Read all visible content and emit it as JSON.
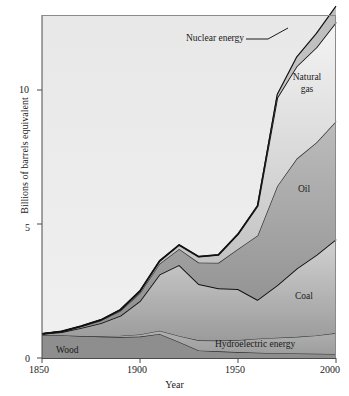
{
  "chart_data": {
    "type": "area",
    "title": "",
    "xlabel": "Year",
    "ylabel": "Billions of barrels equivalent",
    "xlim": [
      1850,
      2000
    ],
    "ylim": [
      0,
      13.1
    ],
    "xticks": [
      "1850",
      "1900",
      "1950",
      "2000"
    ],
    "xtick_values": [
      1850,
      1900,
      1950,
      2000
    ],
    "yticks": [
      "0",
      "5",
      "10"
    ],
    "ytick_values": [
      0,
      5,
      10
    ],
    "grid": false,
    "legend": "inline-band-labels",
    "stacked": true,
    "x": [
      1850,
      1860,
      1870,
      1880,
      1890,
      1900,
      1910,
      1920,
      1930,
      1940,
      1950,
      1960,
      1970,
      1980,
      1990,
      2000
    ],
    "series": [
      {
        "name": "Wood",
        "color": "#8e8e8e",
        "values": [
          0.85,
          0.85,
          0.82,
          0.8,
          0.78,
          0.8,
          0.9,
          0.6,
          0.28,
          0.25,
          0.22,
          0.2,
          0.18,
          0.17,
          0.16,
          0.15
        ]
      },
      {
        "name": "Hydroelectric energy",
        "color": "#a8a8a8",
        "values": [
          0.0,
          0.0,
          0.0,
          0.02,
          0.05,
          0.08,
          0.12,
          0.22,
          0.38,
          0.4,
          0.45,
          0.52,
          0.58,
          0.62,
          0.68,
          0.78
        ]
      },
      {
        "name": "Coal",
        "color": "#b4b4b4",
        "values": [
          0.05,
          0.12,
          0.3,
          0.48,
          0.75,
          1.25,
          2.1,
          2.65,
          2.1,
          1.95,
          1.9,
          1.45,
          1.95,
          2.55,
          3.0,
          3.5
        ]
      },
      {
        "name": "Oil",
        "color": "#9a9a9a",
        "values": [
          0.0,
          0.02,
          0.06,
          0.1,
          0.18,
          0.3,
          0.4,
          0.6,
          0.8,
          0.95,
          1.5,
          2.4,
          3.7,
          4.1,
          4.2,
          4.4
        ]
      },
      {
        "name": "Natural gas",
        "color": "#cfcfcf",
        "values": [
          0.0,
          0.0,
          0.01,
          0.02,
          0.04,
          0.07,
          0.1,
          0.15,
          0.22,
          0.3,
          0.55,
          1.1,
          3.3,
          3.45,
          3.55,
          3.7
        ]
      },
      {
        "name": "Nuclear energy",
        "color": "#bdbdbd",
        "values": [
          0.0,
          0.0,
          0.0,
          0.0,
          0.0,
          0.0,
          0.0,
          0.0,
          0.0,
          0.0,
          0.0,
          0.02,
          0.12,
          0.35,
          0.52,
          0.6
        ]
      }
    ],
    "cumulative_totals": [
      0.9,
      0.99,
      1.19,
      1.42,
      1.8,
      2.5,
      3.62,
      4.22,
      3.78,
      3.85,
      4.62,
      5.69,
      9.83,
      11.24,
      12.11,
      13.13
    ],
    "annotations": [
      {
        "text": "Nuclear energy",
        "x": 1927,
        "y": 12.2,
        "leader": true
      },
      {
        "text": "Natural gas",
        "x": 1979,
        "y": 10.1,
        "leader": false
      },
      {
        "text": "Oil",
        "x": 1982,
        "y": 6.1,
        "leader": false
      },
      {
        "text": "Coal",
        "x": 1982,
        "y": 2.1,
        "leader": false
      },
      {
        "text": "Hydroelectric energy",
        "x": 1965,
        "y": 0.55,
        "leader": false
      },
      {
        "text": "Wood",
        "x": 1866,
        "y": 0.3,
        "leader": false
      }
    ]
  },
  "axis": {
    "y_title": "Billions of barrels equivalent",
    "x_title": "Year",
    "y_tick_0": "0",
    "y_tick_5": "5",
    "y_tick_10": "10",
    "x_tick_1850": "1850",
    "x_tick_1900": "1900",
    "x_tick_1950": "1950",
    "x_tick_2000": "2000"
  },
  "labels": {
    "nuclear": "Nuclear energy",
    "natural_gas_line1": "Natural",
    "natural_gas_line2": "gas",
    "oil": "Oil",
    "coal": "Coal",
    "hydro": "Hydroelectric energy",
    "wood": "Wood"
  },
  "colors": {
    "plot_background": "#ececec",
    "wood": "#8e8e8e",
    "hydro": "#a8a8a8",
    "coal_top": "#cdcdcd",
    "coal_bottom": "#9d9d9d",
    "oil_top": "#b6b6b6",
    "oil_bottom": "#8f8f8f",
    "gas_top": "#f2f2f2",
    "gas_bottom": "#b8b8b8",
    "nuclear": "#c6c6c6",
    "outline": "#111111",
    "axis": "#555555"
  }
}
